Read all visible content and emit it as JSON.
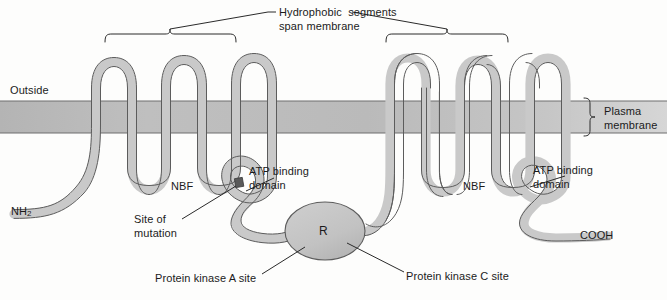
{
  "figure": {
    "title_note": "CFTR protein membrane topology",
    "colors": {
      "protein_fill": "#c9c9c9",
      "protein_stroke": "#4a4a4a",
      "membrane_fill": "#bdbdbd",
      "membrane_line": "#6e6e6e",
      "r_domain_fill": "#c4c4c4",
      "mutation_marker": "#5a5a5a",
      "leader_line": "#2a2a2a",
      "text": "#1b1b1b",
      "background": "#fdfdfc"
    }
  },
  "labels": {
    "hydrophobic_line1": "Hydrophobic  segments",
    "hydrophobic_line2": "span membrane",
    "outside": "Outside",
    "plasma_line1": "Plasma",
    "plasma_line2": "membrane",
    "n_terminus": "NH",
    "n_terminus_sub": "2",
    "c_terminus": "COOH",
    "nbf_left": "NBF",
    "nbf_right": "NBF",
    "atp_left_line1": "ATP binding",
    "atp_left_line2": "domain",
    "atp_right_line1": "ATP binding",
    "atp_right_line2": "domain",
    "site_mutation_line1": "Site of",
    "site_mutation_line2": "mutation",
    "r_domain": "R",
    "pka_site": "Protein kinase A site",
    "pkc_site": "Protein kinase C site"
  },
  "geometry": {
    "membrane_top_y": 101,
    "membrane_bottom_y": 133,
    "left_bracket": {
      "x1": 105,
      "x2": 236,
      "apex_x": 170,
      "y": 34
    },
    "right_bracket": {
      "x1": 386,
      "x2": 508,
      "apex_x": 447,
      "y": 34
    },
    "plasma_brace": {
      "x": 588,
      "y1": 98,
      "y2": 136
    },
    "r_domain": {
      "cx": 325,
      "cy": 231,
      "rx": 40,
      "ry": 29
    },
    "mutation_marker": {
      "x": 208,
      "y": 196
    }
  }
}
